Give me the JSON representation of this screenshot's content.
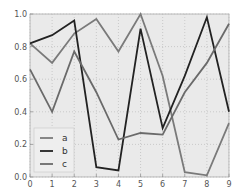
{
  "chart_data": {
    "type": "line",
    "title": "",
    "xlabel": "",
    "ylabel": "",
    "x": [
      0,
      1,
      2,
      3,
      4,
      5,
      6,
      7,
      8,
      9
    ],
    "xlim": [
      0,
      9
    ],
    "ylim": [
      0.0,
      1.0
    ],
    "xticks": [
      "0",
      "1",
      "2",
      "3",
      "4",
      "5",
      "6",
      "7",
      "8",
      "9"
    ],
    "yticks": [
      "0.0",
      "0.2",
      "0.4",
      "0.6",
      "0.8",
      "1.0"
    ],
    "grid": true,
    "legend_position": "lower-left",
    "series": [
      {
        "name": "a",
        "color": "#7a7a7a",
        "values": [
          0.82,
          0.7,
          0.88,
          0.97,
          0.77,
          1.0,
          0.62,
          0.03,
          0.01,
          0.33
        ]
      },
      {
        "name": "b",
        "color": "#222222",
        "values": [
          0.82,
          0.87,
          0.96,
          0.06,
          0.04,
          0.91,
          0.3,
          0.62,
          0.98,
          0.4
        ]
      },
      {
        "name": "c",
        "color": "#6a6a6a",
        "values": [
          0.66,
          0.4,
          0.77,
          0.52,
          0.23,
          0.27,
          0.26,
          0.52,
          0.7,
          0.94
        ]
      }
    ]
  }
}
